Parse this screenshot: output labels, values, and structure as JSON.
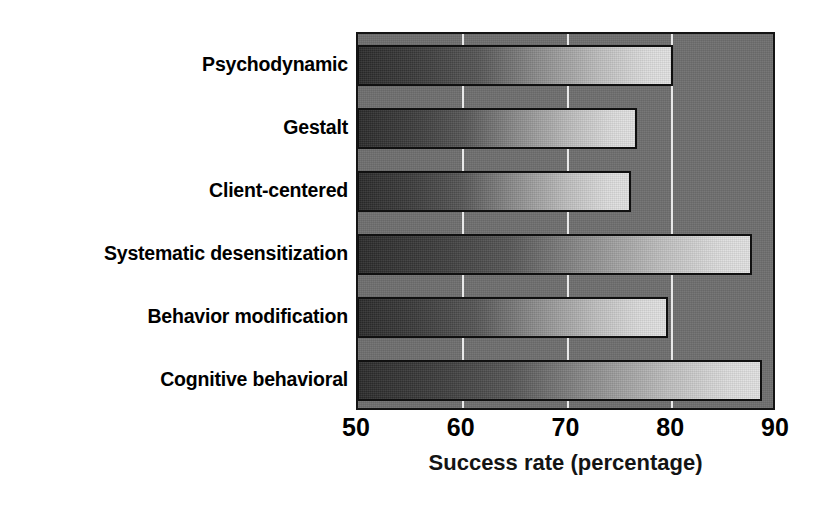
{
  "chart_data": {
    "type": "bar",
    "orientation": "horizontal",
    "title": "",
    "xlabel": "Success rate (percentage)",
    "ylabel": "",
    "categories": [
      "Psychodynamic",
      "Gestalt",
      "Client-centered",
      "Systematic desensitization",
      "Behavior modification",
      "Cognitive behavioral"
    ],
    "values": [
      80,
      76.5,
      76,
      87.5,
      79.5,
      88.5
    ],
    "xlim": [
      50,
      90
    ],
    "xticks": [
      50,
      60,
      70,
      80,
      90
    ],
    "xticklabels": [
      "50",
      "60",
      "70",
      "80",
      "90"
    ],
    "grid": "vertical-only",
    "gridline_values": [
      60,
      70,
      80
    ],
    "legend": null,
    "colors": {
      "plot_background": "#6e6e6e",
      "axis_frame": "#141414",
      "gridline": "#e8e8e8",
      "bar_gradient_start": "#2b2b2b",
      "bar_gradient_end": "#e2e2e2",
      "bar_border": "#101010",
      "text": "#000000",
      "page_background": "#ffffff"
    }
  }
}
